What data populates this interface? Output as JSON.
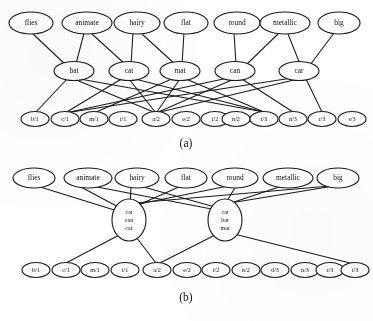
{
  "figure": {
    "panels": [
      {
        "id": "a",
        "caption": "(a)",
        "layers": {
          "attributes": [
            "flies",
            "animate",
            "hairy",
            "flat",
            "round",
            "metallic",
            "big"
          ],
          "words": [
            "bat",
            "cat",
            "mat",
            "can",
            "car"
          ],
          "letters": [
            "b/1",
            "c/1",
            "m/1",
            "t/1",
            "a/2",
            "e/2",
            "i/2",
            "n/2",
            "t/3",
            "n/3",
            "r/3",
            "s/3"
          ]
        },
        "edges_attr_word": [
          [
            "flies",
            "bat"
          ],
          [
            "animate",
            "bat"
          ],
          [
            "animate",
            "cat"
          ],
          [
            "hairy",
            "cat"
          ],
          [
            "hairy",
            "mat"
          ],
          [
            "flat",
            "mat"
          ],
          [
            "round",
            "can"
          ],
          [
            "metallic",
            "can"
          ],
          [
            "metallic",
            "car"
          ],
          [
            "big",
            "car"
          ]
        ],
        "edges_word_letter": [
          [
            "bat",
            "b/1"
          ],
          [
            "bat",
            "a/2"
          ],
          [
            "bat",
            "t/3"
          ],
          [
            "cat",
            "c/1"
          ],
          [
            "cat",
            "a/2"
          ],
          [
            "cat",
            "t/3"
          ],
          [
            "mat",
            "m/1"
          ],
          [
            "mat",
            "a/2"
          ],
          [
            "mat",
            "t/3"
          ],
          [
            "can",
            "c/1"
          ],
          [
            "can",
            "a/2"
          ],
          [
            "can",
            "n/3"
          ],
          [
            "car",
            "c/1"
          ],
          [
            "car",
            "a/2"
          ],
          [
            "car",
            "r/3"
          ]
        ]
      },
      {
        "id": "b",
        "caption": "(b)",
        "layers": {
          "attributes": [
            "flies",
            "animate",
            "hairy",
            "flat",
            "round",
            "metallic",
            "big"
          ],
          "hubs": [
            {
              "id": "hub-left",
              "lines": [
                "cat",
                "can",
                "car"
              ]
            },
            {
              "id": "hub-right",
              "lines": [
                "cat",
                "bat",
                "mat"
              ]
            }
          ],
          "letters": [
            "b/1",
            "c/1",
            "m/1",
            "t/1",
            "a/2",
            "e/2",
            "i/2",
            "n/2",
            "d/3",
            "n/3",
            "r/3",
            "t/3"
          ]
        },
        "edges_attr_hub": [
          [
            "flies",
            "hub-left"
          ],
          [
            "animate",
            "hub-left"
          ],
          [
            "animate",
            "hub-right"
          ],
          [
            "hairy",
            "hub-left"
          ],
          [
            "hairy",
            "hub-right"
          ],
          [
            "flat",
            "hub-left"
          ],
          [
            "round",
            "hub-left"
          ],
          [
            "round",
            "hub-right"
          ],
          [
            "metallic",
            "hub-right"
          ],
          [
            "big",
            "hub-left"
          ],
          [
            "big",
            "hub-right"
          ]
        ],
        "edges_hub_letter": [
          [
            "hub-left",
            "c/1"
          ],
          [
            "hub-left",
            "a/2"
          ],
          [
            "hub-right",
            "a/2"
          ],
          [
            "hub-right",
            "t/3"
          ]
        ]
      }
    ]
  }
}
